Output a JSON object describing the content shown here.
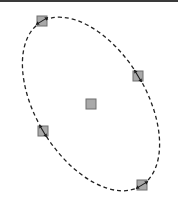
{
  "canvas": {
    "width": 178,
    "height": 204,
    "background": "#ffffff",
    "top_bar_color": "#3a3a3a"
  },
  "ellipse": {
    "name": "ellipse-selection",
    "center": [
      91,
      104
    ],
    "semi_major": 96,
    "semi_minor": 55,
    "rotation_deg": 58.6,
    "stroke": "#222222",
    "stroke_dasharray": "4 3",
    "stroke_width": 1.3
  },
  "handles": {
    "size": 10,
    "fill": "#a9a9a9",
    "stroke": "#6e6e6e",
    "arrow_color": "#1a1a1a",
    "items": [
      {
        "id": "handle-major-top",
        "role": "resize",
        "x": 42,
        "y": 21,
        "arrow_angle_deg": -31
      },
      {
        "id": "handle-minor-right",
        "role": "resize",
        "x": 138,
        "y": 76,
        "arrow_angle_deg": 59
      },
      {
        "id": "handle-center",
        "role": "move",
        "x": 91,
        "y": 104
      },
      {
        "id": "handle-minor-left",
        "role": "resize",
        "x": 43,
        "y": 131,
        "arrow_angle_deg": 59
      },
      {
        "id": "handle-major-bottom",
        "role": "resize",
        "x": 142,
        "y": 185,
        "arrow_angle_deg": -31
      }
    ]
  }
}
